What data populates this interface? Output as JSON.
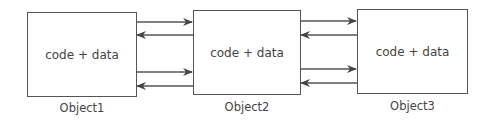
{
  "diagram": {
    "objects": [
      {
        "id": "object1",
        "content": "code + data",
        "label": "Object1"
      },
      {
        "id": "object2",
        "content": "code + data",
        "label": "Object2"
      },
      {
        "id": "object3",
        "content": "code + data",
        "label": "Object3"
      }
    ],
    "connections": [
      {
        "from": "Object1",
        "to": "Object2",
        "direction": "right"
      },
      {
        "from": "Object2",
        "to": "Object1",
        "direction": "left"
      },
      {
        "from": "Object1",
        "to": "Object2",
        "direction": "right"
      },
      {
        "from": "Object2",
        "to": "Object1",
        "direction": "left"
      },
      {
        "from": "Object2",
        "to": "Object3",
        "direction": "right"
      },
      {
        "from": "Object3",
        "to": "Object2",
        "direction": "left"
      },
      {
        "from": "Object2",
        "to": "Object3",
        "direction": "right"
      },
      {
        "from": "Object3",
        "to": "Object2",
        "direction": "left"
      }
    ],
    "colors": {
      "stroke": "#555555",
      "text": "#444444"
    }
  }
}
